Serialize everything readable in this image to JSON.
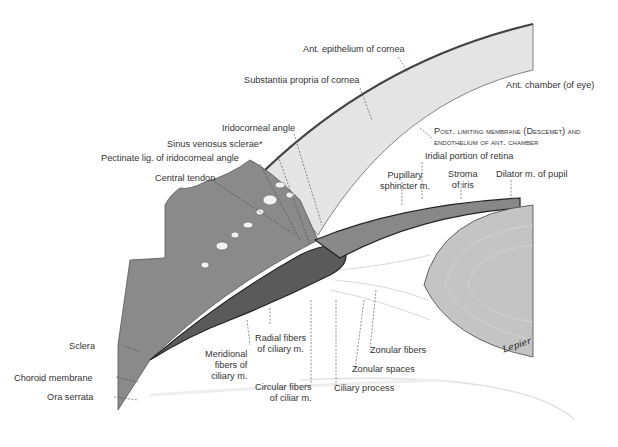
{
  "figure": {
    "signature": "Lepier"
  },
  "labels": {
    "ant_epithelium": "Ant. epithelium of cornea",
    "substantia_propria": "Substantia propria of cornea",
    "ant_chamber": "Ant. chamber (of eye)",
    "iridocorneal_angle": "Iridocorneal angle",
    "post_limiting_1": "Post. limiting membrane (Descemet) and",
    "post_limiting_2": "endothelium of ant. chamber",
    "sinus_venosus": "Sinus venosus sclerae*",
    "pectinate_lig": "Pectinate lig. of iridocorneal angle",
    "iridial_portion": "Iridial portion of retina",
    "central_tendon": "Central tendon",
    "pupillary_1": "Pupillary",
    "pupillary_2": "sphincter m.",
    "stroma_1": "Stroma",
    "stroma_2": "of iris",
    "dilator": "Dilator m. of pupil",
    "sclera": "Sclera",
    "radial_1": "Radial fibers",
    "radial_2": "of ciliary m.",
    "meridional_1": "Meridional",
    "meridional_2": "fibers of",
    "meridional_3": "ciliary m.",
    "zonular_fibers": "Zonular fibers",
    "zonular_spaces": "Zonular spaces",
    "choroid": "Choroid membrane",
    "ora_serrata": "Ora serrata",
    "circular_1": "Circular fibers",
    "circular_2": "of ciliar m.",
    "ciliary_process": "Ciliary process"
  },
  "colors": {
    "cornea": "#e4e4e4",
    "cornea_edge": "#555555",
    "sclera": "#7a7a7a",
    "ciliary": "#6a6a6a",
    "lens": "#c8c8c8",
    "text": "#333333"
  }
}
